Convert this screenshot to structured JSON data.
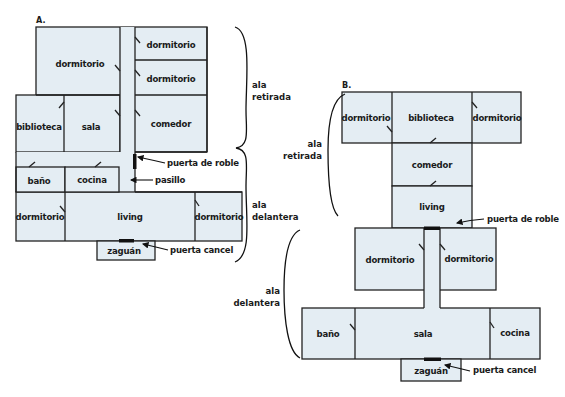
{
  "colors": {
    "room_fill": "#e4edf3",
    "wall": "#222222",
    "door": "#111111"
  },
  "plan_a": {
    "letter": "A.",
    "rooms": {
      "dormitorio_top_left": "dormitorio",
      "dormitorio_top_right_1": "dormitorio",
      "dormitorio_top_right_2": "dormitorio",
      "biblioteca": "biblioteca",
      "sala": "sala",
      "comedor": "comedor",
      "bano": "baño",
      "cocina": "cocina",
      "dormitorio_bottom_left": "dormitorio",
      "living": "living",
      "dormitorio_bottom_right": "dormitorio",
      "zaguan": "zaguán"
    },
    "annotations": {
      "puerta_de_roble": "puerta de roble",
      "pasillo": "pasillo",
      "puerta_cancel": "puerta cancel"
    },
    "wings": {
      "retirada_line1": "ala",
      "retirada_line2": "retirada",
      "delantera_line1": "ala",
      "delantera_line2": "delantera"
    }
  },
  "plan_b": {
    "letter": "B.",
    "rooms": {
      "dormitorio_top_left": "dormitorio",
      "biblioteca": "biblioteca",
      "dormitorio_top_right": "dormitorio",
      "comedor": "comedor",
      "living": "living",
      "dormitorio_mid_left": "dormitorio",
      "dormitorio_mid_right": "dormitorio",
      "bano": "baño",
      "sala": "sala",
      "cocina": "cocina",
      "zaguan": "zaguán"
    },
    "annotations": {
      "puerta_de_roble": "puerta de roble",
      "puerta_cancel": "puerta cancel"
    },
    "wings": {
      "retirada_line1": "ala",
      "retirada_line2": "retirada",
      "delantera_line1": "ala",
      "delantera_line2": "delantera"
    }
  }
}
